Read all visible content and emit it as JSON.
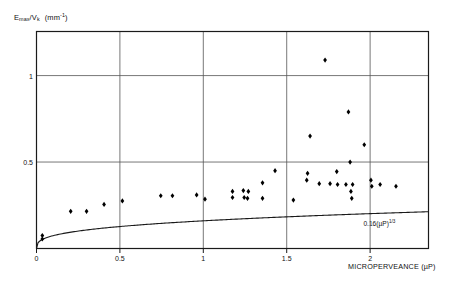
{
  "figure": {
    "background_color": "#ffffff",
    "ink_color": "#1a1a1a",
    "grid_color": "#555555"
  },
  "y_axis_label": {
    "base": "E",
    "subscript": "max",
    "divider": "/V",
    "subscript2": "k",
    "unit": "(mm",
    "unit_exponent": "-1",
    "unit_close": ")"
  },
  "x_axis_label": "MICROPERVEANCE (µP)",
  "curve_equation": {
    "coefficient": "0.16(µP)",
    "exponent": "1/3"
  },
  "chart_data": {
    "type": "scatter",
    "title": "",
    "subtitle": "",
    "xlabel": "MICROPERVEANCE (µP)",
    "ylabel": "Emax/Vk (mm^-1)",
    "xlim": [
      0,
      2.35
    ],
    "ylim": [
      0,
      1.255
    ],
    "xticks": [
      0,
      0.5,
      1,
      1.5,
      2
    ],
    "xticklabels": [
      "0",
      "0.5",
      "1",
      "1.5",
      "2"
    ],
    "yticks": [
      0.5,
      1
    ],
    "yticklabels": [
      "0.5",
      "1"
    ],
    "grid": true,
    "grid_x": [
      0.5,
      1,
      1.5,
      2
    ],
    "grid_y": [
      0.5,
      1
    ],
    "legend": "none",
    "marker": "diamond",
    "marker_color": "#000000",
    "series": [
      {
        "name": "measurements",
        "points": [
          [
            0.035,
            0.075
          ],
          [
            0.035,
            0.055
          ],
          [
            0.205,
            0.215
          ],
          [
            0.3,
            0.215
          ],
          [
            0.405,
            0.255
          ],
          [
            0.515,
            0.275
          ],
          [
            0.745,
            0.305
          ],
          [
            0.815,
            0.305
          ],
          [
            0.96,
            0.31
          ],
          [
            1.01,
            0.285
          ],
          [
            1.175,
            0.33
          ],
          [
            1.175,
            0.295
          ],
          [
            1.24,
            0.335
          ],
          [
            1.245,
            0.295
          ],
          [
            1.265,
            0.29
          ],
          [
            1.27,
            0.33
          ],
          [
            1.355,
            0.38
          ],
          [
            1.355,
            0.29
          ],
          [
            1.43,
            0.45
          ],
          [
            1.54,
            0.28
          ],
          [
            1.62,
            0.395
          ],
          [
            1.625,
            0.435
          ],
          [
            1.64,
            0.65
          ],
          [
            1.695,
            0.375
          ],
          [
            1.73,
            1.09
          ],
          [
            1.76,
            0.375
          ],
          [
            1.8,
            0.445
          ],
          [
            1.805,
            0.37
          ],
          [
            1.855,
            0.37
          ],
          [
            1.87,
            0.79
          ],
          [
            1.88,
            0.5
          ],
          [
            1.885,
            0.33
          ],
          [
            1.89,
            0.29
          ],
          [
            1.895,
            0.37
          ],
          [
            1.965,
            0.6
          ],
          [
            2.005,
            0.395
          ],
          [
            2.01,
            0.36
          ],
          [
            2.06,
            0.37
          ],
          [
            2.155,
            0.36
          ]
        ]
      }
    ],
    "fit_curve": {
      "label": "0.16(µP)^1/3",
      "coefficient": 0.16,
      "exponent": 0.3333333,
      "x_from": 0,
      "x_to": 2.35
    }
  }
}
